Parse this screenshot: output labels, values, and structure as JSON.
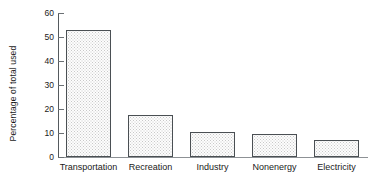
{
  "chart_data": {
    "type": "bar",
    "title": "",
    "xlabel": "",
    "ylabel": "Percentage of total used",
    "categories": [
      "Transportation",
      "Recreation",
      "Industry",
      "Nonenergy",
      "Electricity"
    ],
    "values": [
      53,
      17.5,
      10.5,
      9.5,
      7
    ],
    "ylim": [
      0,
      60
    ],
    "yticks": [
      0,
      10,
      20,
      30,
      40,
      50,
      60
    ],
    "ytick_labels": [
      "0",
      "10",
      "20",
      "30",
      "40",
      "50",
      "60"
    ],
    "grid": false,
    "legend": "none",
    "bar_fill": "#fdfdfd",
    "bar_edge": "#4a4f53",
    "axis_color": "#6b7074",
    "text_color": "#1a1a1a"
  }
}
